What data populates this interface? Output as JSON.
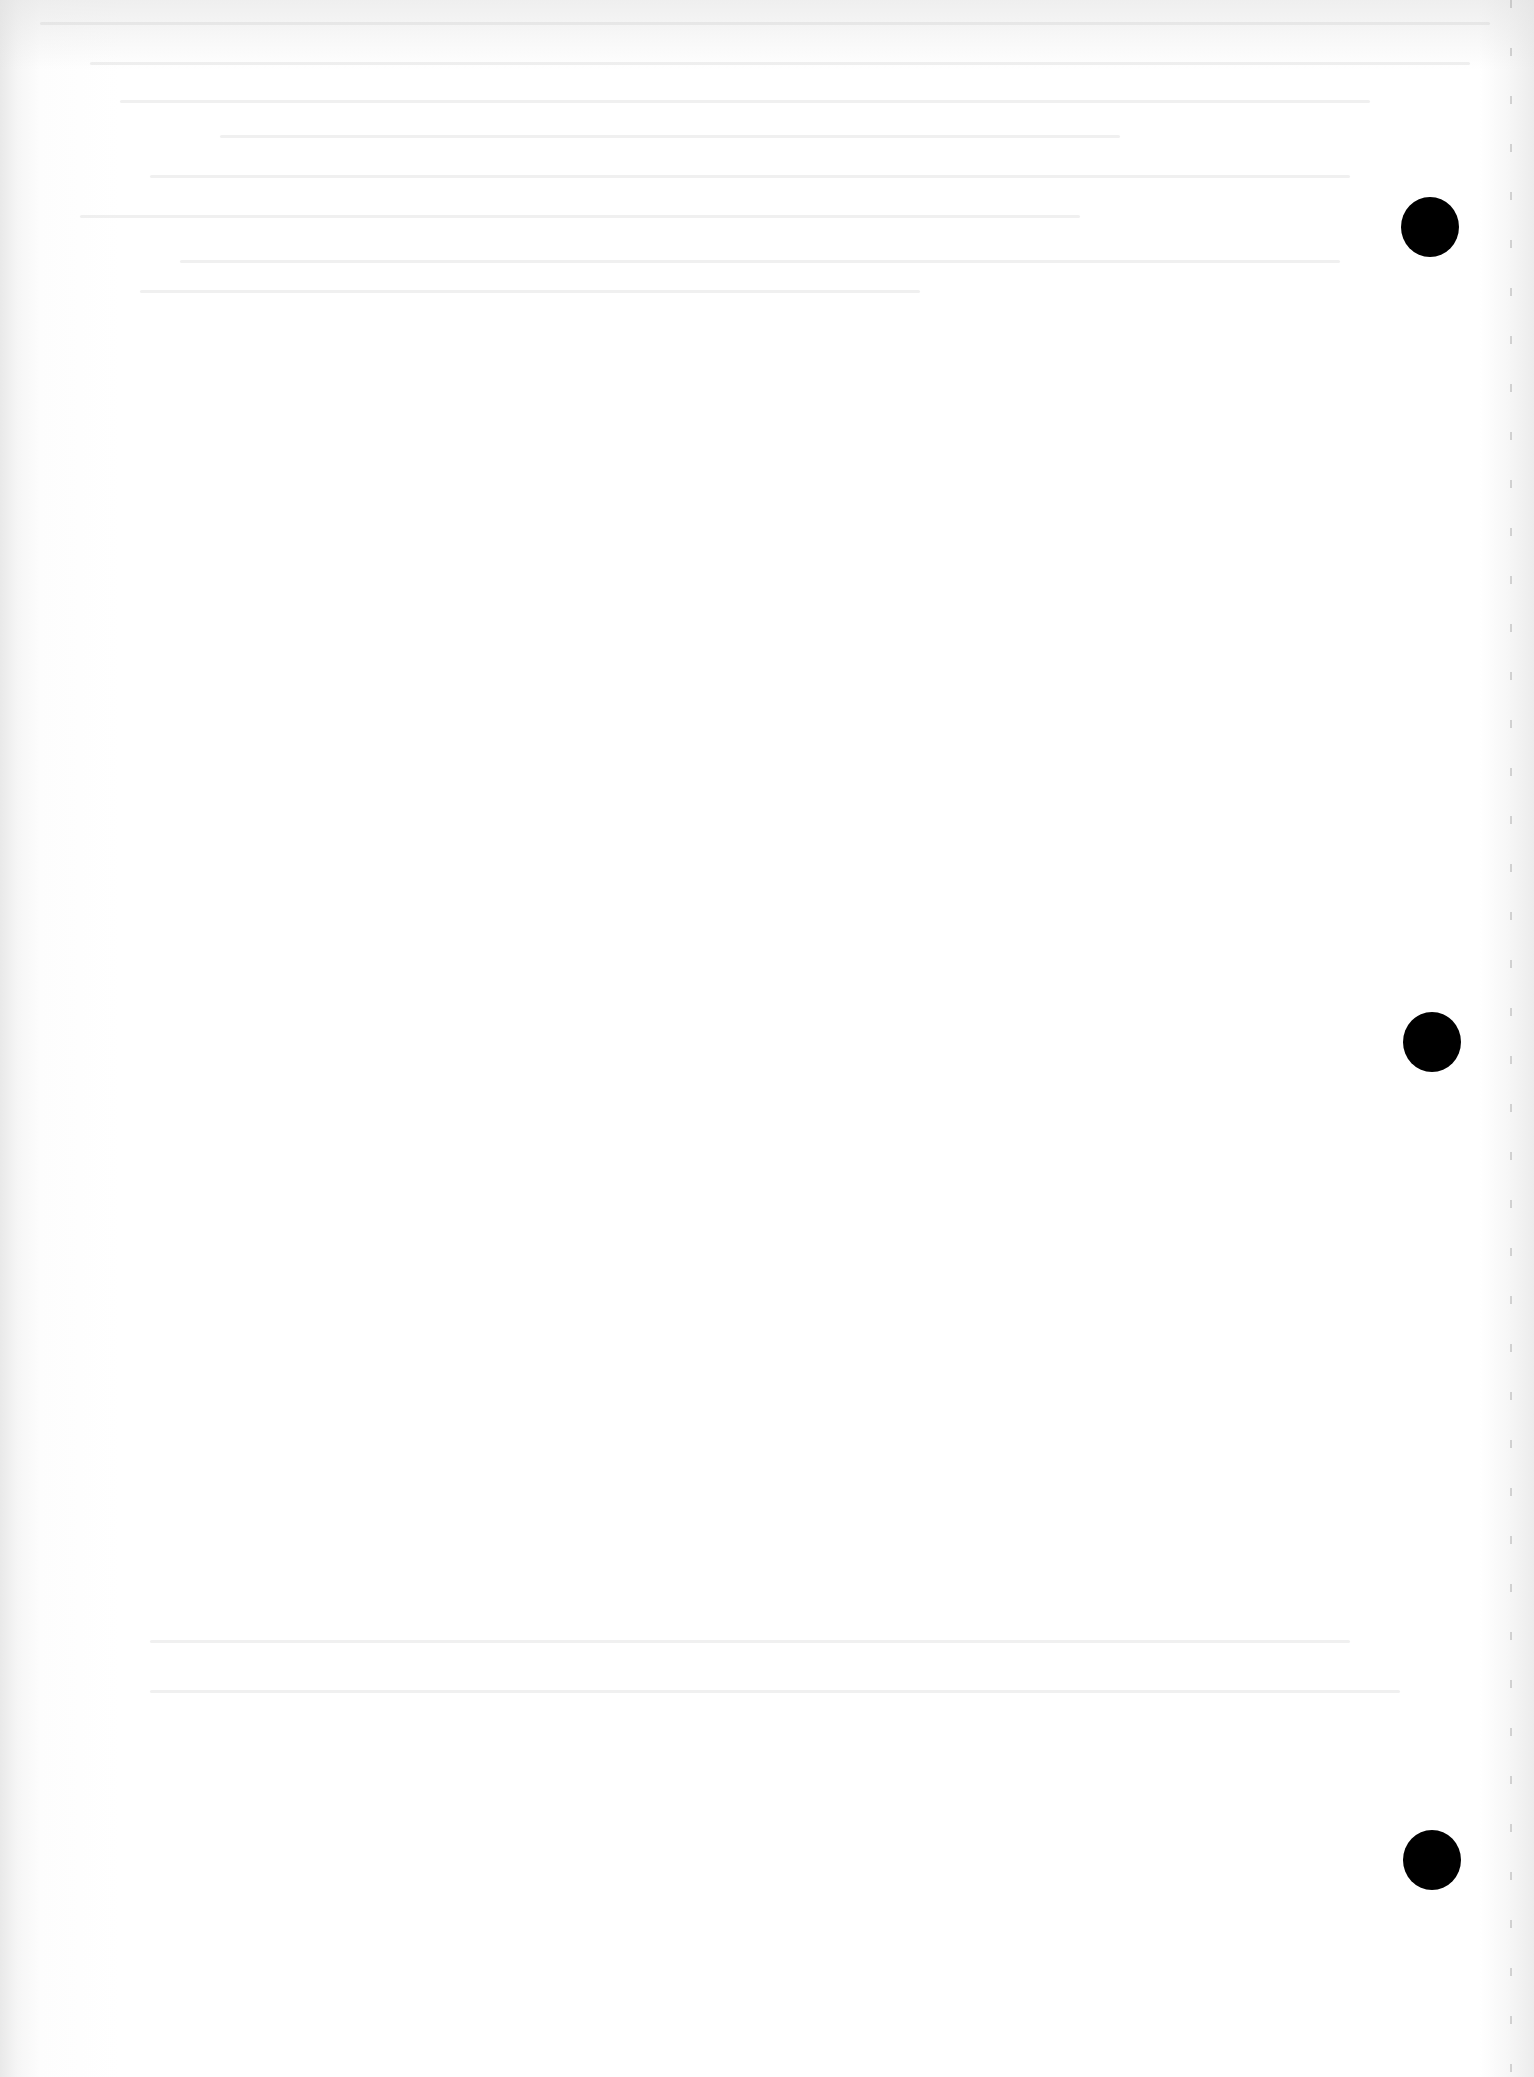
{
  "page": {
    "type": "scanned-blank-sheet",
    "background_color": "#ffffff",
    "legible_text": []
  },
  "punch_holes": [
    {
      "cx": 1430,
      "cy": 227,
      "color": "#000000"
    },
    {
      "cx": 1432,
      "cy": 1042,
      "color": "#000000"
    },
    {
      "cx": 1432,
      "cy": 1860,
      "color": "#000000"
    }
  ]
}
